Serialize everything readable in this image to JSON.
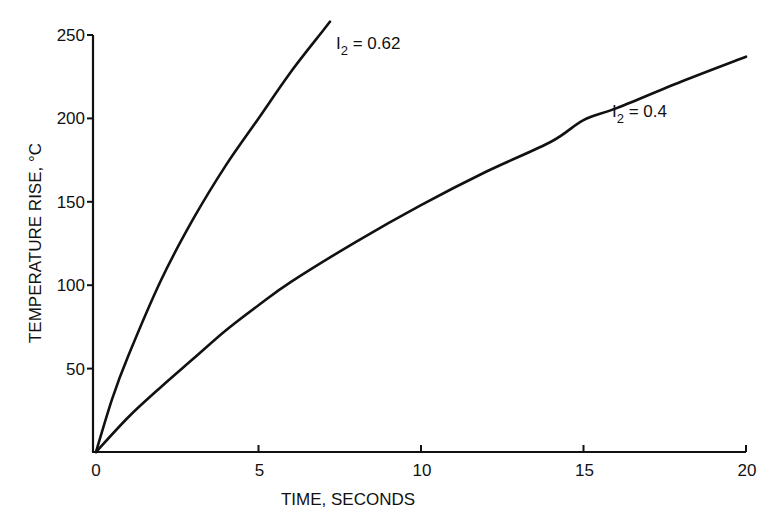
{
  "chart_data": {
    "type": "line",
    "title": "",
    "xlabel": "TIME, SECONDS",
    "ylabel": "TEMPERATURE RISE, °C",
    "xlim": [
      0,
      20
    ],
    "ylim": [
      0,
      250
    ],
    "xticks": [
      0,
      5,
      10,
      15,
      20
    ],
    "yticks": [
      50,
      100,
      150,
      200,
      250
    ],
    "xtick_labels": [
      "0",
      "5",
      "10",
      "15",
      "20"
    ],
    "ytick_labels": [
      "50",
      "100",
      "150",
      "200",
      "250"
    ],
    "grid": false,
    "legend": "inline curve labels",
    "series": [
      {
        "name": "I2 = 0.62",
        "label_main": "I",
        "label_sub": "2",
        "label_rest": " = 0.62",
        "x": [
          0,
          0.5,
          1,
          2,
          3,
          4,
          5,
          6,
          7,
          7.2
        ],
        "y": [
          0,
          32,
          58,
          103,
          140,
          172,
          200,
          228,
          253,
          258
        ]
      },
      {
        "name": "I2 = 0.4",
        "label_main": "I",
        "label_sub": "2",
        "label_rest": " = 0.4",
        "x": [
          0,
          1,
          2,
          3,
          4,
          5,
          6,
          8,
          10,
          12,
          14,
          15,
          16,
          18,
          20
        ],
        "y": [
          0,
          21,
          39,
          56,
          73,
          88,
          102,
          126,
          148,
          168,
          186,
          199,
          206,
          222,
          237
        ]
      }
    ]
  }
}
